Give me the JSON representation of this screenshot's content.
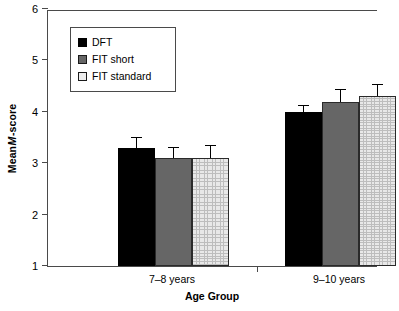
{
  "chart_data": {
    "type": "bar",
    "title": "",
    "subtitle": "",
    "xlabel": "Age Group",
    "ylabel": "Mean M-score",
    "ylabel_parts": {
      "prefix": "Mean ",
      "italic": "M",
      "suffix": "-score"
    },
    "categories": [
      "7–8 years",
      "9–10 years"
    ],
    "series": [
      {
        "name": "DFT",
        "values": [
          3.3,
          4.0
        ],
        "errors": [
          0.2,
          0.12
        ],
        "fill": "black",
        "color": "#000000"
      },
      {
        "name": "FIT short",
        "values": [
          3.1,
          4.2
        ],
        "errors": [
          0.2,
          0.22
        ],
        "fill": "darkgray",
        "color": "#666666"
      },
      {
        "name": "FIT standard",
        "values": [
          3.1,
          4.3
        ],
        "errors": [
          0.23,
          0.23
        ],
        "fill": "hatch",
        "color": "#e8e8e8"
      }
    ],
    "ylim": [
      1,
      6
    ],
    "yticks": [
      1,
      2,
      3,
      4,
      5,
      6
    ],
    "ytick_labels": [
      "1",
      "2",
      "3",
      "4",
      "5",
      "6"
    ],
    "grid": false,
    "legend_position": "upper-left",
    "error_bar_style": "upper-only-cap"
  },
  "legend": {
    "entries": [
      {
        "label": "DFT"
      },
      {
        "label": "FIT short"
      },
      {
        "label": "FIT standard"
      }
    ]
  }
}
